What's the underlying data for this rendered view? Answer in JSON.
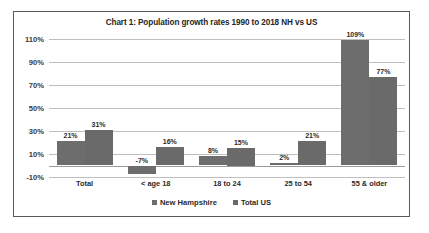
{
  "chart_data": {
    "type": "bar",
    "title": "Chart 1: Population growth rates 1990 to 2018 NH vs US",
    "xlabel": "",
    "ylabel": "",
    "ylim": [
      -10,
      110
    ],
    "ytick_labels": [
      "110%",
      "90%",
      "70%",
      "50%",
      "30%",
      "10%",
      "-10%"
    ],
    "ytick_values": [
      110,
      90,
      70,
      50,
      30,
      10,
      -10
    ],
    "grid": true,
    "legend_position": "bottom",
    "categories": [
      "Total",
      "< age 18",
      "18 to 24",
      "25 to 54",
      "55 & older"
    ],
    "series": [
      {
        "name": "New Hampshire",
        "color": "#6d6d6d",
        "values": [
          21,
          -7,
          8,
          2,
          109
        ],
        "labels": [
          "21%",
          "-7%",
          "8%",
          "2%",
          "109%"
        ]
      },
      {
        "name": "Total US",
        "color": "#6a6a6a",
        "values": [
          31,
          16,
          15,
          21,
          77
        ],
        "labels": [
          "31%",
          "16%",
          "15%",
          "21%",
          "77%"
        ]
      }
    ]
  }
}
